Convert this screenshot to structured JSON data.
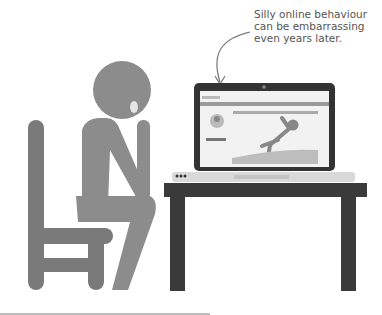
{
  "caption": {
    "lines": [
      "Silly online behaviour",
      "can be embarrassing",
      "even years later."
    ]
  },
  "colors": {
    "figure": "#8c8c8c",
    "chair": "#7a7a7a",
    "table": "#3a3a3a",
    "laptop_frame": "#333333",
    "laptop_base": "#d9d9d9",
    "screen_bg": "#f2f2f2",
    "bar": "#9a9a9a",
    "bottom_rule": "#bdbdbd"
  }
}
